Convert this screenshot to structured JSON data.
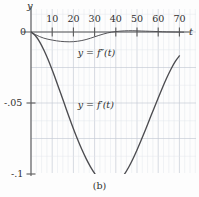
{
  "figure": {
    "caption": "(b)",
    "y_axis_name": "y",
    "x_axis_name": "t",
    "zero_label": "0"
  },
  "chart_data": {
    "type": "line",
    "title": "",
    "xlabel": "t",
    "ylabel": "y",
    "xlim": [
      0,
      73
    ],
    "ylim": [
      -0.128,
      0.006
    ],
    "grid": true,
    "grid_major_x": 10,
    "grid_major_y": 0.025,
    "legend": "inline-annotations",
    "xticks": [
      10,
      20,
      30,
      40,
      50,
      60,
      70
    ],
    "xticklabels": [
      "10",
      "20",
      "30",
      "40",
      "50",
      "60",
      "70"
    ],
    "yticks": [
      0,
      -0.05,
      -0.1
    ],
    "yticklabels": [
      "0",
      "-.05",
      "-.1"
    ],
    "series": [
      {
        "name": "y = f''(t)",
        "label": "y = f″(t)",
        "label_x": 22,
        "label_y": -0.0145,
        "x": [
          0,
          2,
          4,
          6,
          8,
          10,
          12,
          14,
          16,
          18,
          20,
          22,
          24,
          26,
          28,
          30,
          32,
          34,
          36,
          38,
          40,
          42,
          44,
          46,
          48,
          50,
          52,
          54,
          56,
          58,
          60,
          62,
          64,
          66,
          68,
          70,
          72
        ],
        "values": [
          0,
          -0.0018,
          -0.0032,
          -0.0043,
          -0.0051,
          -0.0057,
          -0.0062,
          -0.0066,
          -0.0068,
          -0.0069,
          -0.0068,
          -0.0065,
          -0.006,
          -0.0053,
          -0.0044,
          -0.0034,
          -0.0024,
          -0.0015,
          -0.0007,
          -0.0001,
          0.0003,
          0.0006,
          0.0008,
          0.0009,
          0.0009,
          0.0008,
          0.0007,
          0.0006,
          0.0005,
          0.0004,
          0.0003,
          0.0002,
          0.0001,
          5e-05,
          0.0,
          -5e-05,
          -0.0001
        ]
      },
      {
        "name": "y = f'(t)",
        "label": "y = f′(t)",
        "label_x": 22,
        "label_y": -0.0515,
        "x": [
          0,
          2,
          4,
          6,
          8,
          10,
          12,
          14,
          16,
          18,
          20,
          22,
          24,
          26,
          28,
          30,
          32,
          34,
          36,
          38,
          40,
          42,
          44,
          46,
          48,
          50,
          52,
          54,
          56,
          58,
          60,
          62,
          64,
          66,
          68,
          70
        ],
        "values": [
          0,
          -0.0025,
          -0.0068,
          -0.0125,
          -0.0192,
          -0.0268,
          -0.0348,
          -0.0432,
          -0.0516,
          -0.06,
          -0.0681,
          -0.0757,
          -0.0828,
          -0.0892,
          -0.0948,
          -0.0996,
          -0.1035,
          -0.1063,
          -0.1078,
          -0.108,
          -0.1068,
          -0.1042,
          -0.1003,
          -0.0954,
          -0.0896,
          -0.0831,
          -0.0761,
          -0.0688,
          -0.0613,
          -0.0538,
          -0.0464,
          -0.0392,
          -0.0324,
          -0.0262,
          -0.0208,
          -0.0168
        ]
      }
    ]
  }
}
